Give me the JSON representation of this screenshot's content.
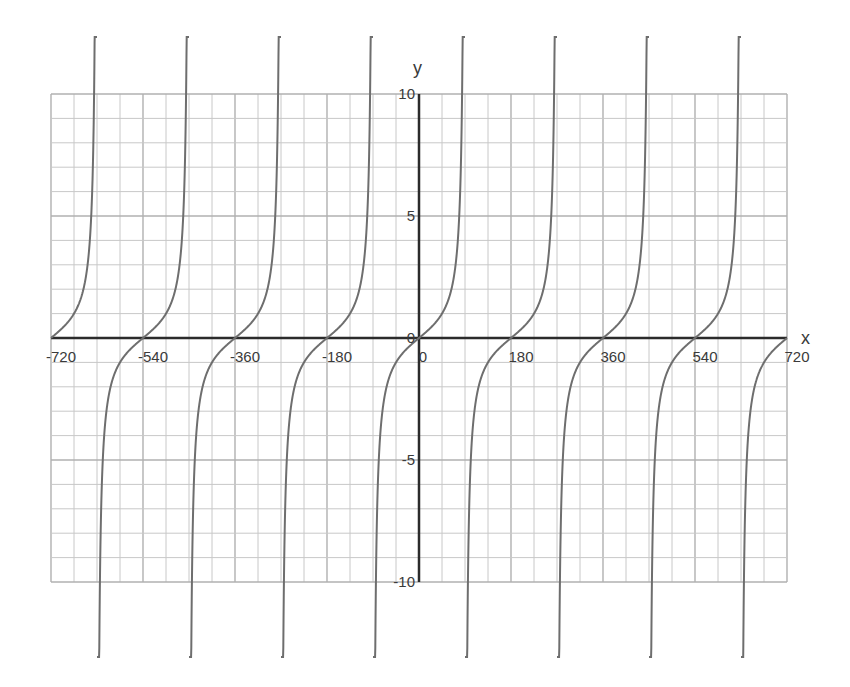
{
  "chart_data": {
    "type": "line",
    "function": "y = tan(x)",
    "title": "",
    "xlabel": "x",
    "ylabel": "y",
    "xlim": [
      -720,
      720
    ],
    "ylim": [
      -10,
      10
    ],
    "grid": true,
    "x_grid_step": 45,
    "y_grid_step": 1,
    "x_ticks": [
      -720,
      -540,
      -360,
      -180,
      0,
      180,
      360,
      540,
      720
    ],
    "x_tick_labels": [
      "-720",
      "-540",
      "-360",
      "-180",
      "0",
      "180",
      "360",
      "540",
      "720"
    ],
    "y_ticks": [
      -10,
      -5,
      0,
      5,
      10
    ],
    "y_tick_labels": [
      "-10",
      "-5",
      "0",
      "5",
      "10"
    ],
    "asymptotes": [
      -630,
      -450,
      -270,
      -90,
      90,
      270,
      450,
      630
    ],
    "zeros": [
      -720,
      -540,
      -360,
      -180,
      0,
      180,
      360,
      540,
      720
    ],
    "series": [
      {
        "name": "tan(x)",
        "color": "#6e6e6e",
        "x_start": -720,
        "x_end": 720,
        "period": 180
      }
    ],
    "colors": {
      "grid": "#c8c8c8",
      "grid_major": "#b0b0b0",
      "axis": "#2b2b2b",
      "curve": "#6e6e6e",
      "text": "#3a3a3a"
    }
  },
  "labels": {
    "x_axis": "x",
    "y_axis": "y",
    "origin_x": "0",
    "origin_y": "0"
  }
}
